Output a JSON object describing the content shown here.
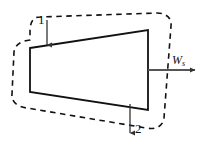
{
  "figure": {
    "type": "control-volume-diagram",
    "background_color": "#ffffff",
    "line_color": "#111111",
    "arrow_color": "#555555",
    "dashed_boundary": {
      "name": "control-volume-boundary",
      "style": "dashed",
      "shape": "rounded-rectangle-tilted"
    },
    "device": {
      "name": "device-body",
      "shape": "trapezoid",
      "style": "solid",
      "fill": "#ffffff"
    },
    "labels": {
      "inlet": "1",
      "outlet": "2",
      "work": "W",
      "work_subscript": "s"
    },
    "arrows": {
      "inlet_direction": "down",
      "outlet_direction": "down",
      "work_direction": "right"
    }
  }
}
